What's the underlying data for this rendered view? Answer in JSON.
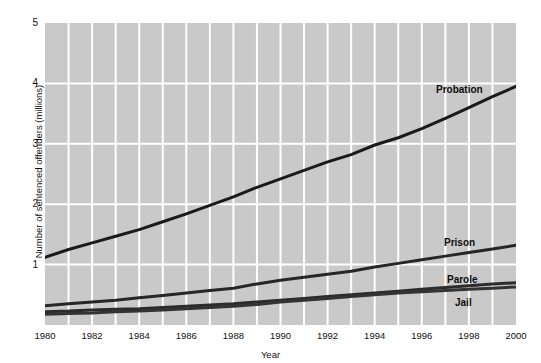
{
  "chart_data": {
    "type": "line",
    "title": "",
    "xlabel": "Year",
    "ylabel": "Number of sentenced offenders (millions)",
    "xlim": [
      1980,
      2000
    ],
    "ylim": [
      0,
      5
    ],
    "grid": true,
    "legend_position": "inline-labels",
    "x_ticks": [
      "1980",
      "1982",
      "1984",
      "1986",
      "1988",
      "1990",
      "1992",
      "1994",
      "1996",
      "1998",
      "2000"
    ],
    "y_ticks": [
      "1",
      "2",
      "3",
      "4",
      "5"
    ],
    "x": [
      1980,
      1981,
      1982,
      1983,
      1984,
      1985,
      1986,
      1987,
      1988,
      1989,
      1990,
      1991,
      1992,
      1993,
      1994,
      1995,
      1996,
      1997,
      1998,
      1999,
      2000
    ],
    "series": [
      {
        "name": "Probation",
        "color": "#1a1a1a",
        "values": [
          1.12,
          1.25,
          1.36,
          1.47,
          1.58,
          1.71,
          1.84,
          1.98,
          2.12,
          2.28,
          2.42,
          2.56,
          2.7,
          2.82,
          2.98,
          3.1,
          3.25,
          3.42,
          3.6,
          3.78,
          3.95
        ]
      },
      {
        "name": "Prison",
        "color": "#262626",
        "values": [
          0.32,
          0.35,
          0.38,
          0.41,
          0.45,
          0.49,
          0.53,
          0.57,
          0.61,
          0.68,
          0.74,
          0.79,
          0.84,
          0.89,
          0.96,
          1.02,
          1.08,
          1.14,
          1.2,
          1.26,
          1.32
        ]
      },
      {
        "name": "Parole",
        "color": "#2b2b2b",
        "values": [
          0.22,
          0.23,
          0.25,
          0.26,
          0.27,
          0.29,
          0.31,
          0.33,
          0.35,
          0.38,
          0.41,
          0.44,
          0.47,
          0.5,
          0.53,
          0.56,
          0.59,
          0.62,
          0.65,
          0.68,
          0.7
        ]
      },
      {
        "name": "Jail",
        "color": "#333333",
        "values": [
          0.18,
          0.19,
          0.2,
          0.22,
          0.23,
          0.25,
          0.27,
          0.29,
          0.31,
          0.34,
          0.38,
          0.41,
          0.44,
          0.47,
          0.5,
          0.53,
          0.55,
          0.57,
          0.59,
          0.61,
          0.63
        ]
      }
    ],
    "series_label_positions": [
      {
        "name": "Probation",
        "left": 436,
        "top": 85
      },
      {
        "name": "Prison",
        "left": 444,
        "top": 238
      },
      {
        "name": "Parole",
        "left": 447,
        "top": 275
      },
      {
        "name": "Jail",
        "left": 455,
        "top": 298
      }
    ]
  },
  "style": {
    "plot_background": "#c9c9c9",
    "gridline_color": "#ffffff",
    "page_background": "#ffffff",
    "text_color": "#111111"
  }
}
